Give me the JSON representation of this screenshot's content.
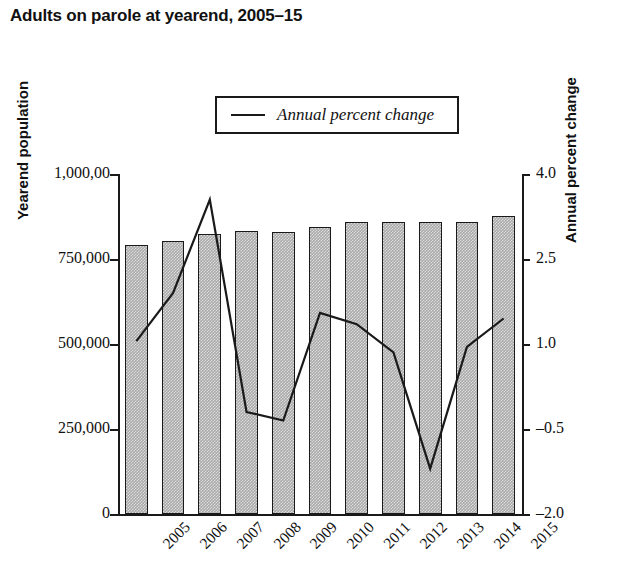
{
  "title": "Adults on parole at yearend, 2005–15",
  "legend": {
    "items": [
      {
        "label": "Annual percent change",
        "marker": "line-segment"
      }
    ]
  },
  "axes": {
    "left": {
      "title": "Yearend population",
      "ticks": [
        "1,000,00",
        "750,000",
        "500,000",
        "250,000",
        "0"
      ],
      "values": [
        1000000,
        750000,
        500000,
        250000,
        0
      ]
    },
    "right": {
      "title": "Annual percent change",
      "ticks": [
        "4.0",
        "2.5",
        "1.0",
        "–0.5",
        "–2.0"
      ],
      "values": [
        4.0,
        2.5,
        1.0,
        -0.5,
        -2.0
      ]
    },
    "bottom": {
      "ticks": [
        "2005",
        "2006",
        "2007",
        "2008",
        "2009",
        "2010",
        "2011",
        "2012",
        "2013",
        "2014",
        "2015"
      ]
    }
  },
  "chart_data": {
    "type": "bar",
    "title": "Adults on parole at yearend, 2005–15",
    "xlabel": "",
    "ylabel": "Yearend population",
    "y2label": "Annual percent change",
    "categories": [
      "2005",
      "2006",
      "2007",
      "2008",
      "2009",
      "2010",
      "2011",
      "2012",
      "2013",
      "2014",
      "2015"
    ],
    "ylim": [
      0,
      1000000
    ],
    "y2lim": [
      -2.0,
      4.0
    ],
    "grid": false,
    "legend_position": "top-center",
    "series": [
      {
        "name": "Yearend population",
        "type": "bar",
        "axis": "left",
        "values": [
          791000,
          803000,
          824000,
          832000,
          829000,
          844000,
          859000,
          860000,
          859000,
          859000,
          876000
        ]
      },
      {
        "name": "Annual percent change",
        "type": "line",
        "axis": "right",
        "values": [
          1.05,
          1.9,
          3.55,
          -0.2,
          -0.35,
          1.55,
          1.35,
          0.85,
          -1.2,
          0.95,
          1.45
        ]
      }
    ]
  }
}
